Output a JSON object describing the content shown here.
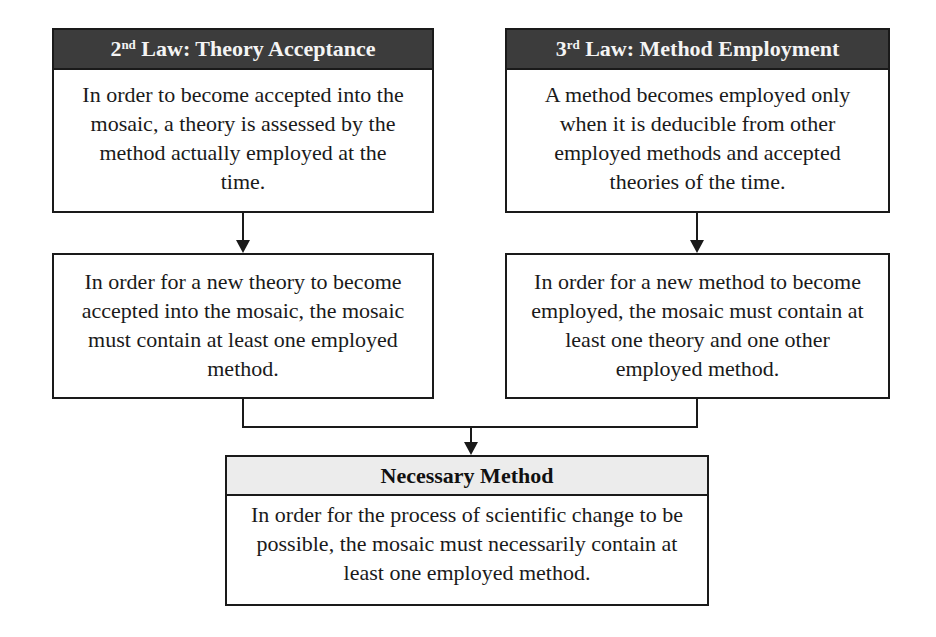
{
  "diagram": {
    "top_left": {
      "header_number": "2",
      "header_ordinal_suffix": "nd",
      "header_rest": " Law: Theory Acceptance",
      "body": "In order to become accepted into the mosaic, a theory is assessed by the method actually employed at the time."
    },
    "top_right": {
      "header_number": "3",
      "header_ordinal_suffix": "rd",
      "header_rest": " Law: Method Employment",
      "body": "A method becomes employed only when it is deducible from other employed methods and accepted theories of the time."
    },
    "mid_left": {
      "body": "In order for a new theory to become accepted into the mosaic, the mosaic must contain at least one employed method."
    },
    "mid_right": {
      "body": "In order for a new method to become employed, the mosaic must contain at least one theory and one other employed method."
    },
    "bottom": {
      "header": "Necessary Method",
      "body": "In order for the process of scientific change to be possible, the mosaic must necessarily contain at least one employed method."
    },
    "colors": {
      "dark_header_bg": "#3c3c3c",
      "light_header_bg": "#ececec",
      "stroke": "#1a1a1a"
    }
  }
}
